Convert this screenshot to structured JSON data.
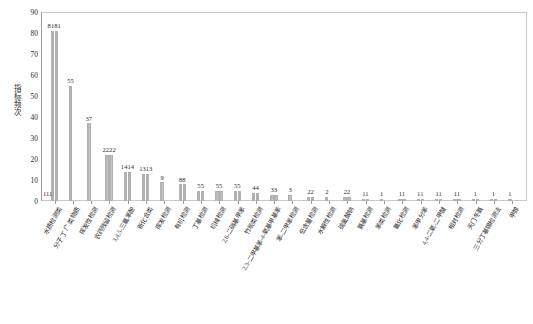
{
  "chart_data": {
    "type": "bar",
    "title": "",
    "xlabel": "",
    "ylabel": "指标频次",
    "ylim": [
      0,
      90
    ],
    "ytick_step": 10,
    "yticks": [
      0,
      10,
      20,
      30,
      40,
      50,
      60,
      70,
      80,
      90
    ],
    "grid": false,
    "legend": "none",
    "categories": [
      "水质检测类",
      "分子 丁 广 类物质",
      "挥发性检测",
      "农药残留检测",
      "3,4,5-三氯苯酚",
      "新化合类",
      "挥发检测",
      "有机检测",
      "丁基检测",
      "机械检测",
      "2,6-二硝基甲苯",
      "竹炭类检测",
      "2,3-二甲基苯-4-氧基甲基苯",
      "苯-二甲苯检测",
      "低含量检测",
      "水解性检测",
      "硫氰酸钠",
      "氨基检测",
      "苯类检测",
      "氯化检测",
      "苯甲分苯",
      "4,4-二氧-二甲醚",
      "相对检测",
      "天门冬氨",
      "三分丁基锡检测法",
      "甲醇"
    ],
    "values": [
      81,
      55,
      37,
      22,
      14,
      13,
      9,
      8,
      5,
      5,
      5,
      4,
      3,
      3,
      2,
      2,
      2,
      1,
      1,
      1,
      1,
      1,
      1,
      1,
      1,
      1
    ],
    "series": [
      {
        "name": "系列1",
        "values": [
          81,
          55,
          37,
          22,
          14,
          13,
          9,
          8,
          5,
          5,
          5,
          4,
          3,
          3,
          2,
          2,
          2,
          1,
          1,
          1,
          1,
          1,
          1,
          1,
          1,
          1
        ]
      },
      {
        "name": "系列2",
        "values": [
          81,
          0,
          0,
          22,
          14,
          13,
          0,
          8,
          5,
          5,
          5,
          4,
          3,
          0,
          2,
          0,
          2,
          1,
          0,
          1,
          1,
          1,
          1,
          1,
          1,
          0
        ]
      }
    ],
    "data_labels": [
      "8181",
      "55",
      "37",
      "2222",
      "1414",
      "1313",
      "9",
      "88",
      "55",
      "55",
      "55",
      "44",
      "33",
      "3",
      "22",
      "2",
      "22",
      "11",
      "1",
      "11",
      "11",
      "11",
      "11",
      "1",
      "1",
      "1"
    ],
    "axis_origin_label": "111"
  },
  "colors": {
    "bar_fill": "#b8b8b8",
    "bar_edge": "#a8a8a8",
    "axis": "#9a9a9a",
    "frame": "#c9c9c9",
    "text": "#2b2b2b",
    "background": "#ffffff"
  }
}
